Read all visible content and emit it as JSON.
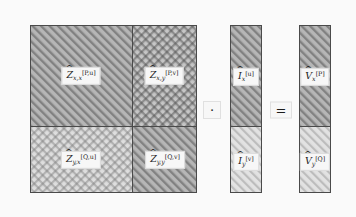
{
  "figure": {
    "background_color": "#fafafa",
    "line_color": "#4a4a4a",
    "hatch_color_dark": "#8c8c8c",
    "hatch_color_light": "#c9c9c9"
  },
  "matrix": {
    "name": "Z-hat block matrix",
    "blocks": [
      {
        "id": "zxx",
        "label_main": "Z",
        "label_sub": "x,x",
        "label_sup": "[P,u]",
        "pattern": "diagonal-dark",
        "position": "top-left"
      },
      {
        "id": "zxy",
        "label_main": "Z",
        "label_sub": "x,y",
        "label_sup": "[P,v]",
        "pattern": "crosshatch-dark",
        "position": "top-right"
      },
      {
        "id": "zyx",
        "label_main": "Z",
        "label_sub": "y,x",
        "label_sup": "[Q,u]",
        "pattern": "crosshatch-light",
        "position": "bottom-left"
      },
      {
        "id": "zyy",
        "label_main": "Z",
        "label_sub": "y,y",
        "label_sup": "[Q,v]",
        "pattern": "diagonal-dark",
        "position": "bottom-right"
      }
    ]
  },
  "current_vector": {
    "name": "I-hat vector",
    "blocks": [
      {
        "id": "iu",
        "label_main": "I",
        "label_sub": "x",
        "label_sup": "[u]",
        "pattern": "diagonal-dark",
        "position": "top"
      },
      {
        "id": "iv",
        "label_main": "I",
        "label_sub": "y",
        "label_sup": "[v]",
        "pattern": "diagonal-light",
        "position": "bottom"
      }
    ]
  },
  "voltage_vector": {
    "name": "V-hat vector",
    "blocks": [
      {
        "id": "vp",
        "label_main": "V",
        "label_sub": "x",
        "label_sup": "[P]",
        "pattern": "diagonal-dark",
        "position": "top"
      },
      {
        "id": "vq",
        "label_main": "V",
        "label_sub": "y",
        "label_sup": "[Q]",
        "pattern": "diagonal-light",
        "position": "bottom"
      }
    ]
  },
  "operators": {
    "multiply": "·",
    "equals": "="
  }
}
